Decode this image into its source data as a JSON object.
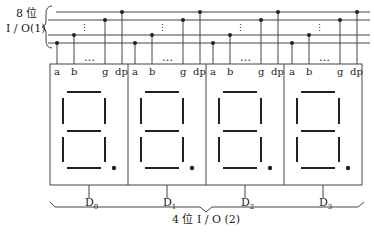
{
  "bus_label_line1": "8 位",
  "bus_label_line2": "I / O(1)",
  "bottom_label": "4 位 I / O (2)",
  "ellipsis_v": "⋮",
  "ellipsis_h": "…",
  "pins": [
    "a",
    "b",
    "g",
    "dp"
  ],
  "digits": [
    {
      "name": "D",
      "sub": "0"
    },
    {
      "name": "D",
      "sub": "1"
    },
    {
      "name": "D",
      "sub": "2"
    },
    {
      "name": "D",
      "sub": "3"
    }
  ],
  "colors": {
    "line": "#333333",
    "segment": "#222222"
  }
}
